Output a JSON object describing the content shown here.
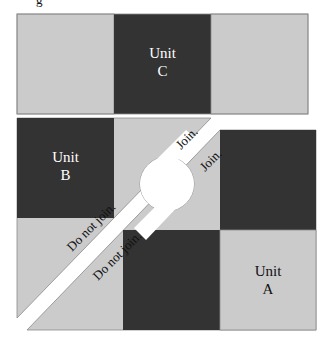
{
  "figure_label_partial": "g",
  "colors": {
    "light": "#cbcbcb",
    "dark": "#333333",
    "border": "#8a8a8a",
    "text_light": "#ffffff",
    "text_dark": "#111111"
  },
  "units": {
    "c": {
      "line1": "Unit",
      "line2": "C"
    },
    "b": {
      "line1": "Unit",
      "line2": "B"
    },
    "a": {
      "line1": "Unit",
      "line2": "A"
    }
  },
  "annotations": {
    "join_upper": "Join.",
    "join_lower": "Join.",
    "do_not_join_upper": "Do not join.",
    "do_not_join_lower": "Do not join."
  }
}
